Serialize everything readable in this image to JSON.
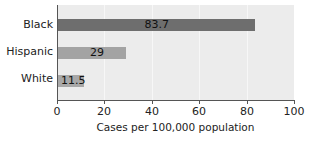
{
  "chart_data": {
    "type": "bar",
    "orientation": "horizontal",
    "title": "",
    "categories": [
      "Black",
      "Hispanic",
      "White"
    ],
    "values": [
      83.7,
      29,
      11.5
    ],
    "data_labels": [
      "83.7",
      "29",
      "11.5"
    ],
    "bar_colors": [
      "#6e6e6e",
      "#a3a3a3",
      "#a8a8a8"
    ],
    "xlabel": "Cases per 100,000 population",
    "ylabel": "",
    "xlim": [
      0,
      100
    ],
    "xticks": [
      0,
      20,
      40,
      60,
      80,
      100
    ],
    "xtick_labels": [
      "0",
      "20",
      "40",
      "60",
      "80",
      "100"
    ],
    "grid": true,
    "legend": null
  },
  "colors": {
    "plot_background": "#ececec",
    "gridline": "#f7f7f7",
    "axis": "#555555"
  }
}
